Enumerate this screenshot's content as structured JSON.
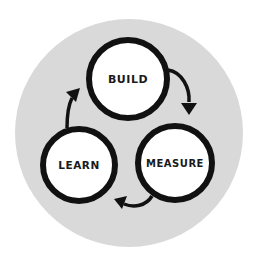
{
  "diagram": {
    "colors": {
      "page_background": "#ffffff",
      "disc_background": "#d9d9d9",
      "node_fill": "#ffffff",
      "stroke": "#111111",
      "text": "#1a1a1a"
    },
    "nodes": [
      {
        "id": "build",
        "label": "BUILD"
      },
      {
        "id": "measure",
        "label": "MEASURE"
      },
      {
        "id": "learn",
        "label": "LEARN"
      }
    ],
    "edges": [
      {
        "from": "build",
        "to": "measure",
        "direction": "clockwise"
      },
      {
        "from": "measure",
        "to": "learn",
        "direction": "clockwise"
      },
      {
        "from": "learn",
        "to": "build",
        "direction": "clockwise"
      }
    ]
  }
}
